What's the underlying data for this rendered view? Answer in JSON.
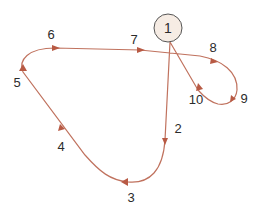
{
  "diagram": {
    "type": "closed-loop path tour",
    "colors": {
      "path": "#c0725e",
      "arrow": "#b85a44",
      "node_fill": "#f6ece4",
      "node_stroke": "#555555",
      "text": "#2b2b2b"
    },
    "start_node": {
      "label": "1"
    },
    "waypoints": [
      {
        "id": "2",
        "label": "2"
      },
      {
        "id": "3",
        "label": "3"
      },
      {
        "id": "4",
        "label": "4"
      },
      {
        "id": "5",
        "label": "5"
      },
      {
        "id": "6",
        "label": "6"
      },
      {
        "id": "7",
        "label": "7"
      },
      {
        "id": "8",
        "label": "8"
      },
      {
        "id": "9",
        "label": "9"
      },
      {
        "id": "10",
        "label": "10"
      }
    ],
    "sequence": [
      "1",
      "2",
      "3",
      "4",
      "5",
      "6",
      "7",
      "8",
      "9",
      "10",
      "1"
    ]
  }
}
